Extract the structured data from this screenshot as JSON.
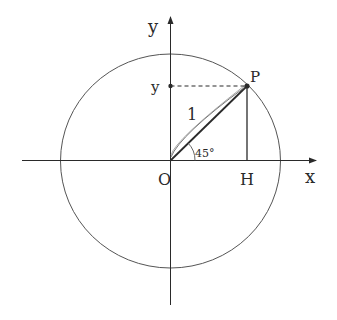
{
  "diagram": {
    "labels": {
      "y_axis": "y",
      "x_axis": "x",
      "y_projection": "y",
      "point_p": "P",
      "origin": "O",
      "foot_h": "H",
      "radius": "1",
      "angle": "45°"
    },
    "colors": {
      "stroke": "#2a2a2a",
      "circle": "#555555",
      "background": "#ffffff"
    }
  }
}
